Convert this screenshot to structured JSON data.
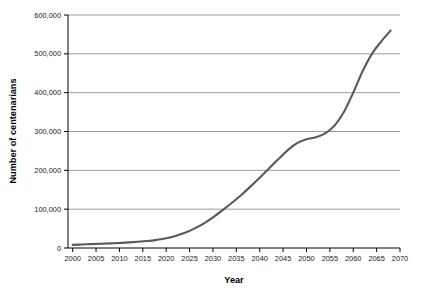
{
  "chart_data": {
    "type": "line",
    "title": "",
    "xlabel": "Year",
    "ylabel": "Number of centenarians",
    "xlim": [
      1999,
      2070
    ],
    "ylim": [
      0,
      600000
    ],
    "grid": "horizontal",
    "legend": "none",
    "line_color": "#595959",
    "axis_color": "#000000",
    "gridline_color": "#808080",
    "x_tick_labels": [
      "2000",
      "2005",
      "2010",
      "2015",
      "2020",
      "2025",
      "2030",
      "2035",
      "2040",
      "2045",
      "2050",
      "2055",
      "2060",
      "2065",
      "2070"
    ],
    "x_ticks": [
      2000,
      2005,
      2010,
      2015,
      2020,
      2025,
      2030,
      2035,
      2040,
      2045,
      2050,
      2055,
      2060,
      2065,
      2070
    ],
    "y_tick_labels": [
      "0",
      "100,000",
      "200,000",
      "300,000",
      "400,000",
      "500,000",
      "600,000"
    ],
    "y_ticks": [
      0,
      100000,
      200000,
      300000,
      400000,
      500000,
      600000
    ],
    "series": [
      {
        "name": "Number of centenarians",
        "x": [
          2000,
          2002,
          2004,
          2006,
          2008,
          2010,
          2012,
          2014,
          2016,
          2018,
          2020,
          2022,
          2024,
          2026,
          2028,
          2030,
          2032,
          2034,
          2036,
          2038,
          2040,
          2042,
          2044,
          2046,
          2048,
          2050,
          2052,
          2054,
          2056,
          2058,
          2060,
          2062,
          2064,
          2066,
          2068
        ],
        "values": [
          8000,
          9000,
          10000,
          11000,
          12000,
          13000,
          14500,
          16000,
          18000,
          21000,
          25000,
          31000,
          39000,
          50000,
          63000,
          79000,
          97000,
          116000,
          136000,
          158000,
          181000,
          205000,
          229000,
          252000,
          270000,
          280000,
          285000,
          295000,
          315000,
          350000,
          400000,
          455000,
          500000,
          532000,
          560000
        ]
      }
    ]
  },
  "figure": {
    "caption": ""
  }
}
